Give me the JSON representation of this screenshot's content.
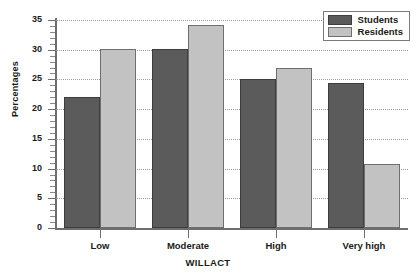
{
  "chart_data": {
    "type": "bar",
    "title": "",
    "xlabel": "WILLACT",
    "ylabel": "Percentages",
    "categories": [
      "Low",
      "Moderate",
      "High",
      "Very high"
    ],
    "series": [
      {
        "name": "Students",
        "color": "#5b5b5b",
        "values": [
          22.0,
          30.1,
          25.1,
          24.4
        ]
      },
      {
        "name": "Residents",
        "color": "#c2c2c2",
        "values": [
          30.1,
          34.2,
          26.9,
          10.8
        ]
      }
    ],
    "ylim": [
      0,
      35
    ],
    "ytick_labels": [
      "0",
      "5",
      "10",
      "15",
      "20",
      "25",
      "30",
      "35"
    ],
    "ytick_values": [
      0,
      5,
      10,
      15,
      20,
      25,
      30,
      35
    ],
    "minor_tick_step": 1,
    "grid": "horizontal-dotted",
    "legend_position": "top-right"
  },
  "legend": {
    "entries": [
      {
        "label": "Students"
      },
      {
        "label": "Residents"
      }
    ]
  }
}
